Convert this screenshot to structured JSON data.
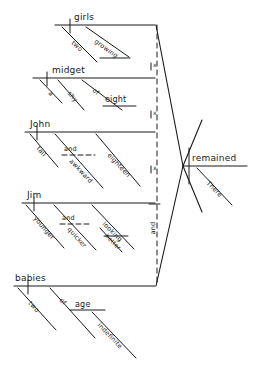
{
  "diagram": {
    "type": "reed-kellogg-sentence-diagram",
    "ink_color": "#1a1a1a",
    "background": "#ffffff",
    "predicate": {
      "verb": "remained",
      "modifier": "There"
    },
    "conjunction_label": "and",
    "compound_marker": "x",
    "subjects": [
      {
        "headword": "girls",
        "modifiers": [
          "two",
          "growing"
        ]
      },
      {
        "headword": "midget",
        "modifiers": [
          "a",
          "shy",
          "of",
          "eight"
        ]
      },
      {
        "headword": "John",
        "modifiers": [
          "tall",
          "and",
          "awkward",
          "eighteen"
        ]
      },
      {
        "headword": "Jim",
        "modifiers": [
          "younger",
          "and",
          "quicker",
          "looking",
          "better"
        ]
      },
      {
        "headword": "babies",
        "modifiers": [
          "two",
          "of",
          "age",
          "indefinite"
        ]
      }
    ],
    "words": {
      "girls": "girls",
      "two_a": "two",
      "growing": "growing",
      "midget": "midget",
      "a": "a",
      "shy": "shy",
      "of_a": "of",
      "eight": "eight",
      "john": "John",
      "tall": "tall",
      "and_1": "and",
      "awkward": "awkward",
      "eighteen": "eighteen",
      "jim": "Jim",
      "younger": "younger",
      "and_2": "and",
      "quicker": "quicker",
      "looking": "looking",
      "better": "better",
      "babies": "babies",
      "two_b": "two",
      "of_b": "of",
      "age": "age",
      "indefinite": "indefinite",
      "remained": "remained",
      "there": "There",
      "and_vertical": "and",
      "x1": "x",
      "x2": "x",
      "x3": "x"
    }
  }
}
